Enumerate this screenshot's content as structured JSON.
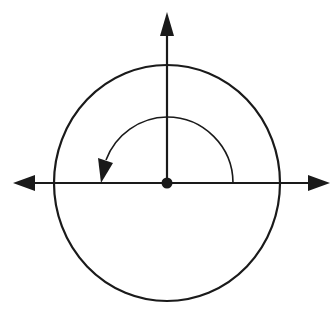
{
  "diagram": {
    "colors": {
      "stroke": "#1a1a1a",
      "background": "#ffffff"
    },
    "center": {
      "x": 167,
      "y": 183
    },
    "circle": {
      "rx": 113,
      "ry": 118
    },
    "rotation_arc": {
      "radius": 66,
      "start_angle_deg": 0,
      "end_angle_deg": 180,
      "direction": "counterclockwise"
    },
    "axes": [
      "x-axis (double-headed arrow)",
      "y-axis (arrow pointing up)"
    ]
  }
}
